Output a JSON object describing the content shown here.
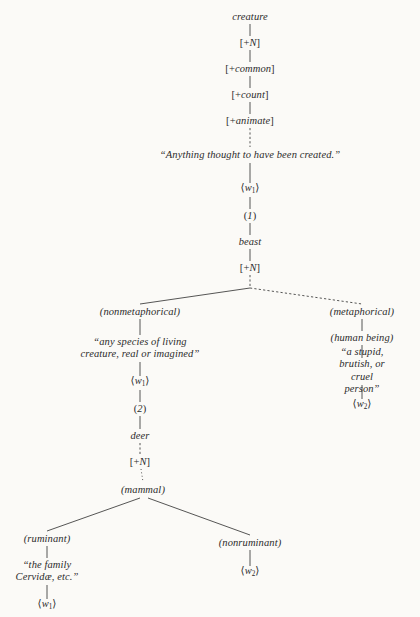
{
  "diagram": {
    "background_color": "#fbfaf7",
    "ink_color": "#2b2b2b",
    "width": 420,
    "height": 617
  },
  "nodes": {
    "creature": {
      "label": "creature",
      "kind": "word",
      "x": 250,
      "y": 17
    },
    "creature_n": {
      "label": "[+N]",
      "kind": "feat",
      "x": 250,
      "y": 43
    },
    "common": {
      "label": "[+common]",
      "kind": "feat",
      "x": 250,
      "y": 69
    },
    "count": {
      "label": "[+count]",
      "kind": "feat",
      "x": 250,
      "y": 95
    },
    "animate": {
      "label": "[+animate]",
      "kind": "feat",
      "x": 250,
      "y": 121
    },
    "creature_gloss": {
      "label": "“Anything thought to have been created.”",
      "kind": "gloss",
      "x": 250,
      "y": 155
    },
    "creature_w1": {
      "label": "⟨w1⟩",
      "kind": "index",
      "x": 250,
      "y": 190
    },
    "sense_1": {
      "label": "(1)",
      "kind": "sense",
      "x": 250,
      "y": 216
    },
    "beast": {
      "label": "beast",
      "kind": "word",
      "x": 250,
      "y": 242
    },
    "beast_n": {
      "label": "[+N]",
      "kind": "feat",
      "x": 250,
      "y": 268
    },
    "nonmetaphorical": {
      "label": "(nonmetaphorical)",
      "kind": "paren",
      "x": 140,
      "y": 312
    },
    "beast_gloss": {
      "label": "“any species of living\ncreature, real or imagined”",
      "kind": "gloss",
      "x": 140,
      "y": 348
    },
    "beast_w1": {
      "label": "⟨w1⟩",
      "kind": "index",
      "x": 140,
      "y": 383
    },
    "sense_2": {
      "label": "(2)",
      "kind": "sense",
      "x": 140,
      "y": 409
    },
    "deer": {
      "label": "deer",
      "kind": "word",
      "x": 140,
      "y": 436
    },
    "deer_n": {
      "label": "[+N]",
      "kind": "feat",
      "x": 140,
      "y": 462
    },
    "mammal": {
      "label": "(mammal)",
      "kind": "paren",
      "x": 143,
      "y": 490
    },
    "metaphorical": {
      "label": "(metaphorical)",
      "kind": "paren",
      "x": 362,
      "y": 312
    },
    "human_being": {
      "label": "(human being)",
      "kind": "paren",
      "x": 362,
      "y": 338
    },
    "beast_gloss_meta": {
      "label": "“a stupid, brutish, or\ncruel person”",
      "kind": "gloss",
      "x": 362,
      "y": 371
    },
    "beast_w2": {
      "label": "⟨w2⟩",
      "kind": "index",
      "x": 362,
      "y": 406
    },
    "ruminant": {
      "label": "(ruminant)",
      "kind": "paren",
      "x": 47,
      "y": 539
    },
    "ruminant_gloss": {
      "label": "“the family\nCervidæ, etc.”",
      "kind": "gloss",
      "x": 47,
      "y": 571
    },
    "ruminant_w1": {
      "label": "⟨w1⟩",
      "kind": "index",
      "x": 47,
      "y": 606
    },
    "nonruminant": {
      "label": "(nonruminant)",
      "kind": "paren",
      "x": 250,
      "y": 543
    },
    "nonruminant_w2": {
      "label": "⟨w2⟩",
      "kind": "index",
      "x": 250,
      "y": 573
    }
  },
  "edges": [
    {
      "name": "creature-to-N",
      "from": [
        250,
        24
      ],
      "to": [
        250,
        36
      ],
      "style": "solid"
    },
    {
      "name": "N-to-common",
      "from": [
        250,
        50
      ],
      "to": [
        250,
        62
      ],
      "style": "solid"
    },
    {
      "name": "common-to-count",
      "from": [
        250,
        76
      ],
      "to": [
        250,
        88
      ],
      "style": "solid"
    },
    {
      "name": "count-to-animate",
      "from": [
        250,
        102
      ],
      "to": [
        250,
        114
      ],
      "style": "solid"
    },
    {
      "name": "animate-to-gloss",
      "from": [
        250,
        128
      ],
      "to": [
        250,
        147
      ],
      "style": "dashed"
    },
    {
      "name": "gloss-to-w1",
      "from": [
        250,
        163
      ],
      "to": [
        250,
        183
      ],
      "style": "solid"
    },
    {
      "name": "w1-to-sense1",
      "from": [
        250,
        197
      ],
      "to": [
        250,
        209
      ],
      "style": "solid"
    },
    {
      "name": "sense1-to-beast",
      "from": [
        250,
        223
      ],
      "to": [
        250,
        235
      ],
      "style": "solid"
    },
    {
      "name": "beast-to-N",
      "from": [
        250,
        249
      ],
      "to": [
        250,
        261
      ],
      "style": "solid"
    },
    {
      "name": "beastN-to-fork",
      "from": [
        250,
        275
      ],
      "to": [
        250,
        288
      ],
      "style": "dashed"
    },
    {
      "name": "fork-to-nonmetaphorical",
      "from": [
        250,
        288
      ],
      "to": [
        140,
        304
      ],
      "style": "solid"
    },
    {
      "name": "fork-to-metaphorical",
      "from": [
        250,
        288
      ],
      "to": [
        362,
        304
      ],
      "style": "dashed"
    },
    {
      "name": "nonmeta-to-gloss",
      "from": [
        140,
        319
      ],
      "to": [
        140,
        335
      ],
      "style": "solid"
    },
    {
      "name": "gloss-to-beastw1",
      "from": [
        140,
        362
      ],
      "to": [
        140,
        376
      ],
      "style": "solid"
    },
    {
      "name": "beastw1-to-sense2",
      "from": [
        140,
        390
      ],
      "to": [
        140,
        402
      ],
      "style": "solid"
    },
    {
      "name": "sense2-to-deer",
      "from": [
        140,
        416
      ],
      "to": [
        140,
        429
      ],
      "style": "solid"
    },
    {
      "name": "deer-to-N",
      "from": [
        140,
        443
      ],
      "to": [
        140,
        455
      ],
      "style": "dashed"
    },
    {
      "name": "deerN-to-mammal",
      "from": [
        141,
        469
      ],
      "to": [
        143,
        482
      ],
      "style": "dotted"
    },
    {
      "name": "mammal-to-ruminant",
      "from": [
        140,
        498
      ],
      "to": [
        47,
        531
      ],
      "style": "solid"
    },
    {
      "name": "mammal-to-nonruminant",
      "from": [
        148,
        498
      ],
      "to": [
        250,
        535
      ],
      "style": "solid"
    },
    {
      "name": "ruminant-to-gloss",
      "from": [
        47,
        546
      ],
      "to": [
        47,
        558
      ],
      "style": "solid"
    },
    {
      "name": "ruminantgloss-to-w1",
      "from": [
        47,
        585
      ],
      "to": [
        47,
        599
      ],
      "style": "solid"
    },
    {
      "name": "nonruminant-to-w2",
      "from": [
        250,
        550
      ],
      "to": [
        250,
        566
      ],
      "style": "solid"
    },
    {
      "name": "meta-to-humanbeing",
      "from": [
        362,
        319
      ],
      "to": [
        362,
        331
      ],
      "style": "solid"
    },
    {
      "name": "humanbeing-to-gloss",
      "from": [
        362,
        345
      ],
      "to": [
        362,
        358
      ],
      "style": "solid"
    },
    {
      "name": "metagloss-to-w2",
      "from": [
        362,
        385
      ],
      "to": [
        362,
        399
      ],
      "style": "solid"
    }
  ]
}
